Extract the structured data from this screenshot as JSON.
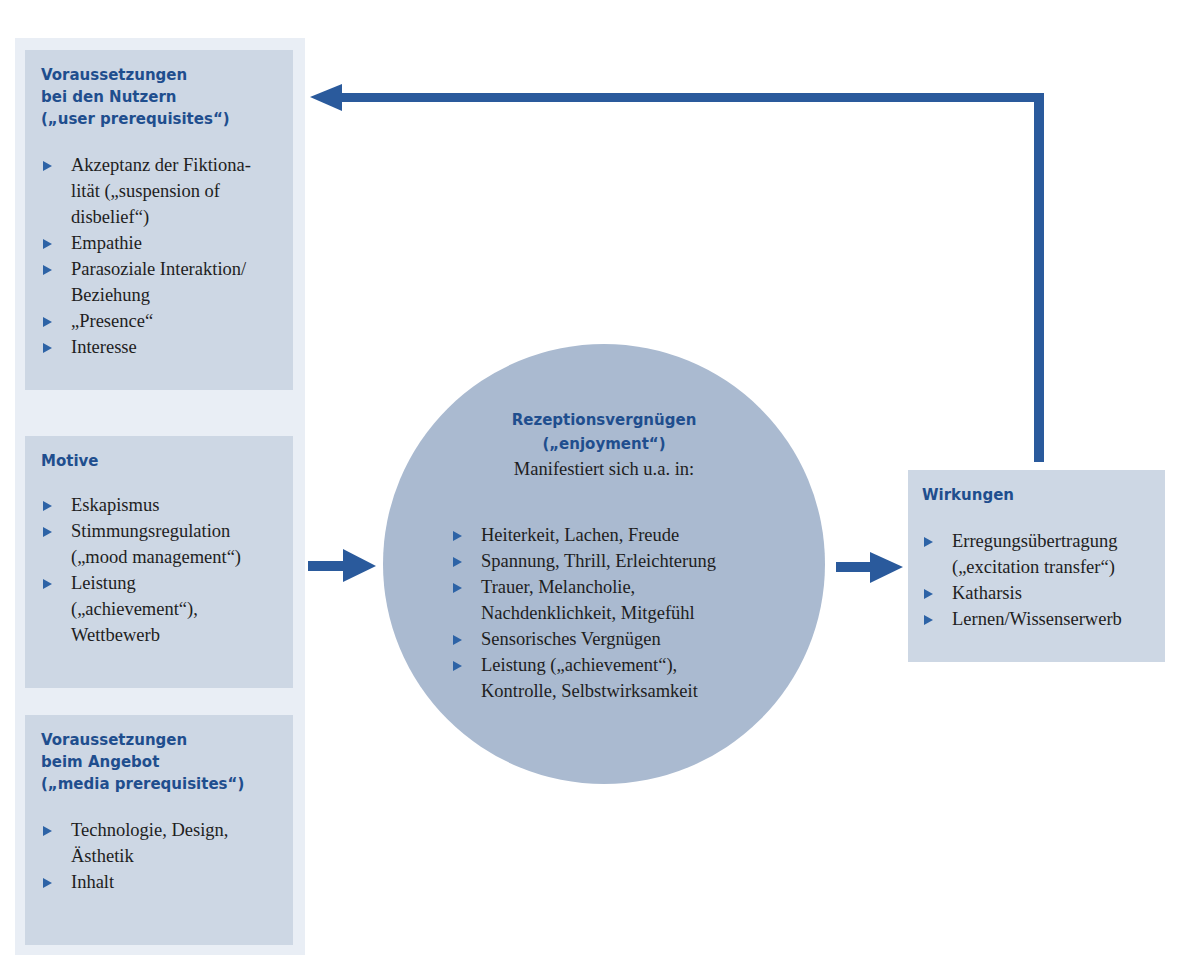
{
  "colors": {
    "heading": "#1f4e8e",
    "arrow": "#2a5a9c",
    "box_fill": "#cdd7e4",
    "panel_fill": "#e9eef5",
    "circle_fill": "#aabad0",
    "bullet": "#2d63a6"
  },
  "left_column": {
    "user_prerequisites": {
      "title": "Voraussetzungen\nbei den Nutzern\n(„user prerequisites“)",
      "items": [
        "Akzeptanz der Fiktiona-\nlität („suspension of\ndisbelief“)",
        "Empathie",
        "Parasoziale Interaktion/\nBeziehung",
        "„Presence“",
        "Interesse"
      ]
    },
    "motives": {
      "title": "Motive",
      "items": [
        "Eskapismus",
        "Stimmungsregulation\n(„mood management“)",
        "Leistung\n(„achievement“),\nWettbewerb"
      ]
    },
    "media_prerequisites": {
      "title": "Voraussetzungen\nbeim Angebot\n(„media prerequisites“)",
      "items": [
        "Technologie, Design,\nÄsthetik",
        "Inhalt"
      ]
    }
  },
  "center": {
    "title_line1": "Rezeptionsvergnügen",
    "title_line2": "(„enjoyment“)",
    "subtitle": "Manifestiert sich u.a. in:",
    "items": [
      "Heiterkeit, Lachen, Freude",
      "Spannung, Thrill, Erleichterung",
      "Trauer, Melancholie,\nNachdenklichkeit, Mitgefühl",
      "Sensorisches Vergnügen",
      "Leistung („achievement“),\nKontrolle, Selbstwirksamkeit"
    ]
  },
  "right": {
    "effects": {
      "title": "Wirkungen",
      "items": [
        "Erregungsübertragung\n(„excitation transfer“)",
        "Katharsis",
        "Lernen/Wissenserwerb"
      ]
    }
  },
  "arrows": [
    {
      "from": "left_column",
      "to": "center"
    },
    {
      "from": "center",
      "to": "effects"
    },
    {
      "from": "effects",
      "to": "user_prerequisites",
      "kind": "feedback"
    }
  ]
}
